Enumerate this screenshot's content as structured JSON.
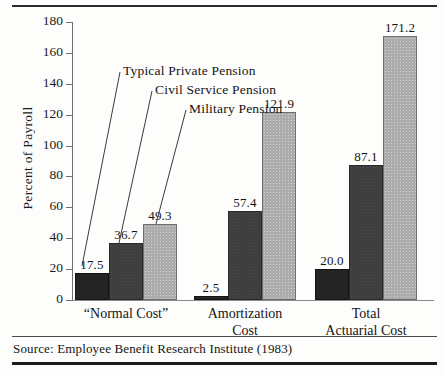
{
  "figure": {
    "source_note": "Source: Employee Benefit Research Institute (1983)"
  },
  "chart_data": {
    "type": "bar",
    "title": "",
    "xlabel": "",
    "ylabel": "Percent of Payroll",
    "ylim": [
      0,
      180
    ],
    "ytick_step": 20,
    "yticks": [
      "0",
      "20",
      "40",
      "60",
      "80",
      "100",
      "120",
      "140",
      "160",
      "180"
    ],
    "grid": false,
    "legend_position": "inline-annotations",
    "categories": [
      "“Normal Cost”",
      "Amortization Cost",
      "Total Actuarial Cost"
    ],
    "category_lines": [
      [
        "“Normal Cost”"
      ],
      [
        "Amortization",
        "Cost"
      ],
      [
        "Total",
        "Actuarial Cost"
      ]
    ],
    "series": [
      {
        "name": "Typical Private Pension",
        "color": "#242424",
        "values": [
          17.5,
          2.5,
          20.0
        ],
        "labels": [
          "17.5",
          "2.5",
          "20.0"
        ]
      },
      {
        "name": "Civil Service Pension",
        "color": "#3e3e3e",
        "values": [
          36.7,
          57.4,
          87.1
        ],
        "labels": [
          "36.7",
          "57.4",
          "87.1"
        ]
      },
      {
        "name": "Military Pension",
        "color": "#acacac",
        "values": [
          49.3,
          121.9,
          171.2
        ],
        "labels": [
          "49.3",
          "121.9",
          "171.2"
        ]
      }
    ],
    "annotations": [
      {
        "text": "Typical Private Pension"
      },
      {
        "text": "Civil Service Pension"
      },
      {
        "text": "Military Pension"
      }
    ]
  }
}
